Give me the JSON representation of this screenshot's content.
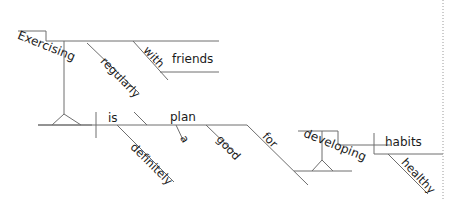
{
  "diagram": {
    "type": "reed-kellogg-sentence-diagram",
    "sentence": "Exercising regularly with friends is definitely a good plan for developing healthy habits.",
    "colors": {
      "line": "#6e6e6e",
      "line_soft": "#8d8d8d",
      "text": "#1b1b1b",
      "margin_rule": "#9a9a9a",
      "background": "#ffffff"
    },
    "words": {
      "subject_gerund": "Exercising",
      "subject_gerund_modifier": "regularly",
      "subject_preposition": "with",
      "subject_prep_object": "friends",
      "verb": "is",
      "verb_modifier": "definitely",
      "predicate_noun": "plan",
      "predicate_article": "a",
      "predicate_adjective": "good",
      "predicate_preposition": "for",
      "prep_object_gerund": "developing",
      "gerund_object": "habits",
      "gerund_object_modifier": "healthy"
    },
    "margin_rule": {
      "label": "right-margin-rule",
      "x": 443,
      "style": "dotted"
    }
  }
}
